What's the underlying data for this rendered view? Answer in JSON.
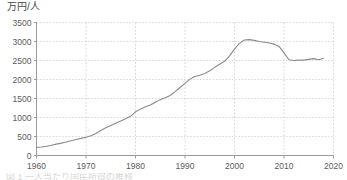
{
  "figure": {
    "y_axis_unit_label": "万円/人",
    "cut_off_caption": "図 1 一人当たり国民所得の推移",
    "line_color": "#8a8a8a",
    "grid_color": "#cfcfcf",
    "axis_color": "#9a9a9a",
    "text_color": "#5a5a5a",
    "background_color": "#ffffff"
  },
  "chart_data": {
    "type": "line",
    "title": "",
    "subtitle": "",
    "xlabel": "",
    "ylabel": "万円/人",
    "xlim": [
      1960,
      2020
    ],
    "ylim": [
      0,
      3500
    ],
    "xticks": [
      1960,
      1970,
      1980,
      1990,
      2000,
      2010,
      2020
    ],
    "yticks": [
      0,
      500,
      1000,
      1500,
      2000,
      2500,
      3000,
      3500
    ],
    "xtick_labels": [
      "1960",
      "1970",
      "1980",
      "1990",
      "2000",
      "2010",
      "2020"
    ],
    "ytick_labels": [
      "0",
      "500",
      "1000",
      "1500",
      "2000",
      "2500",
      "3000",
      "3500"
    ],
    "grid": true,
    "grid_style": "dotted",
    "legend": null,
    "legend_position": "none",
    "annotations": [],
    "series": [
      {
        "name": "一人当たり国民所得",
        "color": "#8a8a8a",
        "x": [
          1960,
          1961,
          1962,
          1963,
          1964,
          1965,
          1966,
          1967,
          1968,
          1969,
          1970,
          1971,
          1972,
          1973,
          1974,
          1975,
          1976,
          1977,
          1978,
          1979,
          1980,
          1981,
          1982,
          1983,
          1984,
          1985,
          1986,
          1987,
          1988,
          1989,
          1990,
          1991,
          1992,
          1993,
          1994,
          1995,
          1996,
          1997,
          1998,
          1999,
          2000,
          2001,
          2002,
          2003,
          2004,
          2005,
          2006,
          2007,
          2008,
          2009,
          2010,
          2011,
          2012,
          2013,
          2014,
          2015,
          2016,
          2017,
          2018
        ],
        "values": [
          210,
          225,
          245,
          270,
          300,
          325,
          355,
          390,
          420,
          450,
          480,
          520,
          580,
          660,
          730,
          790,
          850,
          910,
          970,
          1030,
          1150,
          1220,
          1280,
          1330,
          1400,
          1470,
          1520,
          1580,
          1680,
          1790,
          1900,
          2010,
          2080,
          2110,
          2160,
          2230,
          2320,
          2400,
          2480,
          2620,
          2800,
          2950,
          3040,
          3050,
          3030,
          3000,
          2980,
          2960,
          2930,
          2870,
          2700,
          2520,
          2500,
          2510,
          2510,
          2530,
          2550,
          2520,
          2560
        ]
      }
    ]
  }
}
